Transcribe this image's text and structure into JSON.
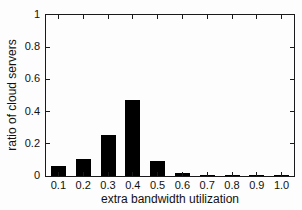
{
  "chart_data": {
    "type": "bar",
    "title": "",
    "xlabel": "extra bandwidth utilization",
    "ylabel": "ratio of cloud servers",
    "categories": [
      "0.1",
      "0.2",
      "0.3",
      "0.4",
      "0.5",
      "0.6",
      "0.7",
      "0.8",
      "0.9",
      "1.0"
    ],
    "values": [
      0.065,
      0.105,
      0.255,
      0.475,
      0.095,
      0.02,
      0.007,
      0.005,
      0.005,
      0.007
    ],
    "ylim": [
      0,
      1
    ],
    "xlim_categories": true,
    "ytick_labels": [
      "0",
      "0.2",
      "0.4",
      "0.6",
      "0.8",
      "1"
    ],
    "ytick_values": [
      0,
      0.2,
      0.4,
      0.6,
      0.8,
      1
    ],
    "bar_color": "#000000",
    "axis_color": "#1a1a1a",
    "text_color": "#111111",
    "background_color": "#fdfdfd",
    "bar_width_fraction": 0.6,
    "grid": false,
    "legend": null,
    "frame": "box-with-inward-ticks"
  }
}
